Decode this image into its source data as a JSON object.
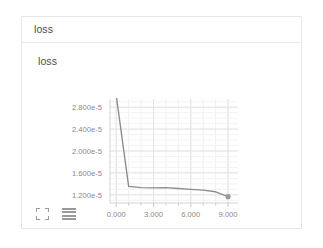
{
  "card": {
    "header_title": "loss",
    "panel_title": "loss"
  },
  "toolbar": {
    "expand_icon": "expand-icon",
    "menu_icon": "menu-icon"
  },
  "chart_data": {
    "type": "line",
    "title": "loss",
    "xlabel": "",
    "ylabel": "",
    "xlim": [
      -0.5,
      9.8
    ],
    "ylim": [
      1.05e-05,
      2.95e-05
    ],
    "grid": true,
    "legend": false,
    "line_color": "#8c8c8c",
    "marker_color": "#9a9a9a",
    "xticks": [
      0,
      3,
      6,
      9
    ],
    "xticklabels": [
      "0.000",
      "3.000",
      "6.000",
      "9.000"
    ],
    "yticks": [
      1.2e-05,
      1.6e-05,
      2e-05,
      2.4e-05,
      2.8e-05
    ],
    "yticklabels": [
      "1.200e-5",
      "1.600e-5",
      "2.000e-5",
      "2.400e-5",
      "2.800e-5"
    ],
    "series": [
      {
        "name": "loss",
        "x": [
          0,
          1,
          2,
          3,
          4,
          5,
          6,
          7,
          8,
          9
        ],
        "values": [
          3.02e-05,
          1.355e-05,
          1.33e-05,
          1.325e-05,
          1.33e-05,
          1.315e-05,
          1.3e-05,
          1.285e-05,
          1.255e-05,
          1.165e-05
        ],
        "marker_points": [
          {
            "x": 9,
            "y": 1.165e-05
          }
        ]
      }
    ]
  }
}
